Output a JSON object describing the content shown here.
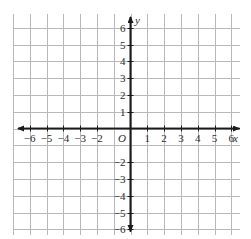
{
  "figure": {
    "kind": "cartesian-coordinate-grid",
    "background_color": "#ffffff",
    "grid_color": "#b8b8b8",
    "axis_color": "#1a1a1a",
    "label_color": "#2b2b2b",
    "origin_label": "O",
    "x_axis_name": "x",
    "y_axis_name": "y"
  },
  "chart_data": {
    "type": "scatter",
    "title": "",
    "xlabel": "x",
    "ylabel": "y",
    "xlim": [
      -7,
      7
    ],
    "ylim": [
      -7,
      7
    ],
    "grid": true,
    "legend": "none",
    "series": [],
    "x_tick_labels": [
      "-6",
      "-5",
      "-4",
      "-3",
      "-2",
      "1",
      "2",
      "3",
      "4",
      "5",
      "6"
    ],
    "y_tick_labels": [
      "6",
      "5",
      "4",
      "3",
      "2",
      "1",
      "-2",
      "-3",
      "-4",
      "-5",
      "-6"
    ],
    "x_ticks": [
      -6,
      -5,
      -4,
      -3,
      -2,
      1,
      2,
      3,
      4,
      5,
      6
    ],
    "y_ticks": [
      6,
      5,
      4,
      3,
      2,
      1,
      -2,
      -3,
      -4,
      -5,
      -6
    ],
    "omitted_tick_labels": [
      -1
    ],
    "origin_marker": "O"
  },
  "x_labels": [
    {
      "text": "−6",
      "value": -6
    },
    {
      "text": "−5",
      "value": -5
    },
    {
      "text": "−4",
      "value": -4
    },
    {
      "text": "−3",
      "value": -3
    },
    {
      "text": "−2",
      "value": -2
    },
    {
      "text": "1",
      "value": 1
    },
    {
      "text": "2",
      "value": 2
    },
    {
      "text": "3",
      "value": 3
    },
    {
      "text": "4",
      "value": 4
    },
    {
      "text": "5",
      "value": 5
    },
    {
      "text": "6",
      "value": 6
    }
  ],
  "y_labels": [
    {
      "text": "6",
      "value": 6
    },
    {
      "text": "5",
      "value": 5
    },
    {
      "text": "4",
      "value": 4
    },
    {
      "text": "3",
      "value": 3
    },
    {
      "text": "2",
      "value": 2
    },
    {
      "text": "1",
      "value": 1
    },
    {
      "text": "−2",
      "value": -2
    },
    {
      "text": "−3",
      "value": -3
    },
    {
      "text": "−4",
      "value": -4
    },
    {
      "text": "−5",
      "value": -5
    },
    {
      "text": "−6",
      "value": -6
    }
  ]
}
